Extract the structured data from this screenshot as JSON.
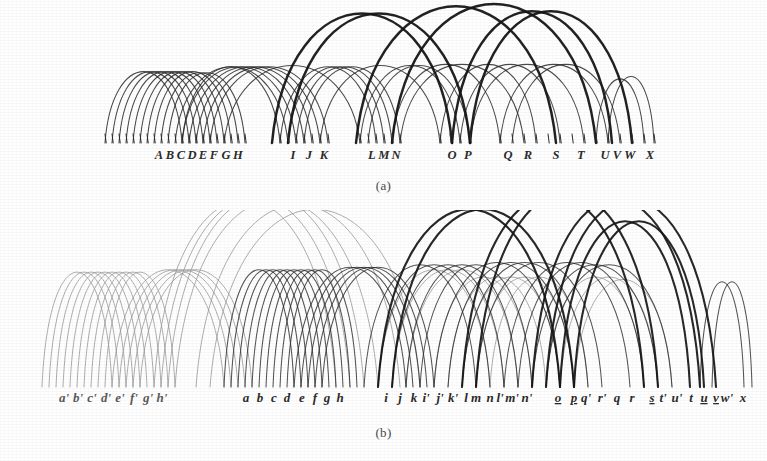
{
  "figure": {
    "type": "arc-diagram-pair",
    "background": "#ffffff",
    "ink_color": "#2b2b2b",
    "faded_ink_color": "#9a9a9a",
    "bold_ink_color": "#161616"
  },
  "captions": {
    "a": "(a)",
    "b": "(b)"
  },
  "panel_a": {
    "name": "panel-a",
    "baseline_y": 143,
    "labels": [
      {
        "text": "A",
        "x": 159
      },
      {
        "text": "B",
        "x": 170
      },
      {
        "text": "C",
        "x": 181
      },
      {
        "text": "D",
        "x": 192
      },
      {
        "text": "E",
        "x": 203
      },
      {
        "text": "F",
        "x": 214
      },
      {
        "text": "G",
        "x": 226
      },
      {
        "text": "H",
        "x": 238
      },
      {
        "text": "I",
        "x": 293
      },
      {
        "text": "J",
        "x": 309
      },
      {
        "text": "K",
        "x": 324
      },
      {
        "text": "L",
        "x": 372
      },
      {
        "text": "M",
        "x": 384
      },
      {
        "text": "N",
        "x": 396
      },
      {
        "text": "O",
        "x": 452
      },
      {
        "text": "P",
        "x": 468
      },
      {
        "text": "Q",
        "x": 508
      },
      {
        "text": "R",
        "x": 528
      },
      {
        "text": "S",
        "x": 556
      },
      {
        "text": "T",
        "x": 581
      },
      {
        "text": "U",
        "x": 605
      },
      {
        "text": "V",
        "x": 617
      },
      {
        "text": "W",
        "x": 630
      },
      {
        "text": "X",
        "x": 650
      }
    ],
    "ticks": [
      105,
      112,
      119,
      126,
      133,
      140,
      147,
      154,
      161,
      168,
      175,
      182,
      189,
      196,
      203,
      210,
      217,
      224,
      231,
      238,
      245,
      280,
      288,
      296,
      304,
      312,
      320,
      328,
      360,
      368,
      376,
      384,
      392,
      400,
      440,
      450,
      460,
      470,
      500,
      512,
      524,
      536,
      548,
      560,
      572,
      584,
      596,
      608,
      620,
      632,
      644,
      654
    ],
    "arcs_thin": [
      {
        "x1": 105,
        "x2": 182,
        "top": 84
      },
      {
        "x1": 112,
        "x2": 189,
        "top": 84
      },
      {
        "x1": 119,
        "x2": 196,
        "top": 84
      },
      {
        "x1": 126,
        "x2": 203,
        "top": 84
      },
      {
        "x1": 133,
        "x2": 210,
        "top": 84
      },
      {
        "x1": 140,
        "x2": 217,
        "top": 84
      },
      {
        "x1": 147,
        "x2": 224,
        "top": 84
      },
      {
        "x1": 154,
        "x2": 231,
        "top": 84
      },
      {
        "x1": 161,
        "x2": 238,
        "top": 85
      },
      {
        "x1": 168,
        "x2": 245,
        "top": 85
      },
      {
        "x1": 175,
        "x2": 288,
        "top": 80
      },
      {
        "x1": 182,
        "x2": 296,
        "top": 80
      },
      {
        "x1": 189,
        "x2": 304,
        "top": 80
      },
      {
        "x1": 196,
        "x2": 312,
        "top": 80
      },
      {
        "x1": 203,
        "x2": 320,
        "top": 80
      },
      {
        "x1": 210,
        "x2": 328,
        "top": 80
      },
      {
        "x1": 280,
        "x2": 376,
        "top": 80
      },
      {
        "x1": 288,
        "x2": 384,
        "top": 80
      },
      {
        "x1": 296,
        "x2": 392,
        "top": 80
      },
      {
        "x1": 304,
        "x2": 400,
        "top": 80
      },
      {
        "x1": 360,
        "x2": 460,
        "top": 79
      },
      {
        "x1": 368,
        "x2": 470,
        "top": 79
      },
      {
        "x1": 400,
        "x2": 524,
        "top": 78
      },
      {
        "x1": 440,
        "x2": 536,
        "top": 78
      },
      {
        "x1": 460,
        "x2": 560,
        "top": 78
      },
      {
        "x1": 470,
        "x2": 584,
        "top": 78
      },
      {
        "x1": 500,
        "x2": 608,
        "top": 78
      },
      {
        "x1": 512,
        "x2": 620,
        "top": 78
      },
      {
        "x1": 596,
        "x2": 644,
        "top": 90
      },
      {
        "x1": 608,
        "x2": 654,
        "top": 88
      },
      {
        "x1": 182,
        "x2": 280,
        "top": 80
      },
      {
        "x1": 224,
        "x2": 360,
        "top": 79
      },
      {
        "x1": 320,
        "x2": 440,
        "top": 79
      },
      {
        "x1": 392,
        "x2": 500,
        "top": 78
      }
    ],
    "arcs_bold": [
      {
        "x1": 272,
        "x2": 452,
        "top": 36
      },
      {
        "x1": 288,
        "x2": 470,
        "top": 36
      },
      {
        "x1": 356,
        "x2": 556,
        "top": 30
      },
      {
        "x1": 392,
        "x2": 596,
        "top": 28
      },
      {
        "x1": 452,
        "x2": 612,
        "top": 34
      },
      {
        "x1": 470,
        "x2": 632,
        "top": 34
      }
    ]
  },
  "panel_b": {
    "name": "panel-b",
    "baseline_y": 387,
    "labels": [
      {
        "text": "a'",
        "x": 64,
        "faded": true
      },
      {
        "text": "b'",
        "x": 78,
        "faded": true
      },
      {
        "text": "c'",
        "x": 92,
        "faded": true
      },
      {
        "text": "d'",
        "x": 106,
        "faded": true
      },
      {
        "text": "e'",
        "x": 120,
        "faded": true
      },
      {
        "text": "f'",
        "x": 134,
        "faded": true
      },
      {
        "text": "g'",
        "x": 148,
        "faded": true
      },
      {
        "text": "h'",
        "x": 162,
        "faded": true
      },
      {
        "text": "a",
        "x": 246,
        "faded": false
      },
      {
        "text": "b",
        "x": 260,
        "faded": false
      },
      {
        "text": "c",
        "x": 274,
        "faded": false
      },
      {
        "text": "d",
        "x": 287,
        "faded": false
      },
      {
        "text": "e",
        "x": 302,
        "faded": false
      },
      {
        "text": "f",
        "x": 315,
        "faded": false
      },
      {
        "text": "g",
        "x": 327,
        "faded": false
      },
      {
        "text": "h",
        "x": 340,
        "faded": false
      },
      {
        "text": "i",
        "x": 386,
        "faded": false
      },
      {
        "text": "j",
        "x": 400,
        "faded": false
      },
      {
        "text": "k",
        "x": 414,
        "faded": false
      },
      {
        "text": "i'",
        "x": 426,
        "faded": false
      },
      {
        "text": "j'",
        "x": 440,
        "faded": false
      },
      {
        "text": "k'",
        "x": 453,
        "faded": false
      },
      {
        "text": "l",
        "x": 466,
        "faded": false
      },
      {
        "text": "m",
        "x": 476,
        "faded": false
      },
      {
        "text": "n",
        "x": 490,
        "faded": false
      },
      {
        "text": "l'",
        "x": 500,
        "faded": false
      },
      {
        "text": "m'",
        "x": 512,
        "faded": false
      },
      {
        "text": "n'",
        "x": 527,
        "faded": false
      },
      {
        "text": "o",
        "x": 558,
        "faded": false,
        "underline": true
      },
      {
        "text": "p",
        "x": 574,
        "faded": false,
        "underline": true
      },
      {
        "text": "q'",
        "x": 586,
        "faded": false
      },
      {
        "text": "r'",
        "x": 602,
        "faded": false
      },
      {
        "text": "q",
        "x": 617,
        "faded": false
      },
      {
        "text": "r",
        "x": 632,
        "faded": false
      },
      {
        "text": "s",
        "x": 652,
        "faded": false,
        "underline": true
      },
      {
        "text": "t'",
        "x": 663,
        "faded": false
      },
      {
        "text": "u'",
        "x": 677,
        "faded": false
      },
      {
        "text": "t",
        "x": 691,
        "faded": false
      },
      {
        "text": "u",
        "x": 704,
        "faded": false,
        "underline": true
      },
      {
        "text": "v",
        "x": 716,
        "faded": false,
        "underline": true
      },
      {
        "text": "w'",
        "x": 727,
        "faded": false
      },
      {
        "text": "x",
        "x": 743,
        "faded": false
      }
    ],
    "arcs_faded": [
      {
        "x1": 42,
        "x2": 112,
        "top": 292
      },
      {
        "x1": 49,
        "x2": 119,
        "top": 292
      },
      {
        "x1": 56,
        "x2": 126,
        "top": 292
      },
      {
        "x1": 63,
        "x2": 133,
        "top": 292
      },
      {
        "x1": 70,
        "x2": 140,
        "top": 292
      },
      {
        "x1": 77,
        "x2": 147,
        "top": 292
      },
      {
        "x1": 84,
        "x2": 154,
        "top": 292
      },
      {
        "x1": 91,
        "x2": 161,
        "top": 292
      },
      {
        "x1": 98,
        "x2": 168,
        "top": 292
      },
      {
        "x1": 105,
        "x2": 175,
        "top": 292
      },
      {
        "x1": 112,
        "x2": 224,
        "top": 290
      },
      {
        "x1": 119,
        "x2": 231,
        "top": 290
      },
      {
        "x1": 126,
        "x2": 238,
        "top": 290
      },
      {
        "x1": 133,
        "x2": 245,
        "top": 290
      },
      {
        "x1": 140,
        "x2": 252,
        "top": 290
      },
      {
        "x1": 154,
        "x2": 336,
        "top": 232
      },
      {
        "x1": 161,
        "x2": 350,
        "top": 230
      },
      {
        "x1": 168,
        "x2": 364,
        "top": 228
      },
      {
        "x1": 175,
        "x2": 378,
        "top": 232
      },
      {
        "x1": 196,
        "x2": 400,
        "top": 236
      },
      {
        "x1": 210,
        "x2": 420,
        "top": 240
      },
      {
        "x1": 434,
        "x2": 532,
        "top": 296
      },
      {
        "x1": 448,
        "x2": 546,
        "top": 296
      },
      {
        "x1": 462,
        "x2": 560,
        "top": 296
      },
      {
        "x1": 476,
        "x2": 574,
        "top": 296
      },
      {
        "x1": 490,
        "x2": 588,
        "top": 296
      },
      {
        "x1": 546,
        "x2": 644,
        "top": 296
      },
      {
        "x1": 560,
        "x2": 658,
        "top": 296
      },
      {
        "x1": 574,
        "x2": 672,
        "top": 298
      },
      {
        "x1": 378,
        "x2": 490,
        "top": 290
      },
      {
        "x1": 392,
        "x2": 504,
        "top": 290
      },
      {
        "x1": 406,
        "x2": 518,
        "top": 290
      }
    ],
    "arcs_thin": [
      {
        "x1": 224,
        "x2": 294,
        "top": 290
      },
      {
        "x1": 231,
        "x2": 301,
        "top": 290
      },
      {
        "x1": 238,
        "x2": 308,
        "top": 290
      },
      {
        "x1": 245,
        "x2": 315,
        "top": 290
      },
      {
        "x1": 252,
        "x2": 322,
        "top": 290
      },
      {
        "x1": 259,
        "x2": 329,
        "top": 290
      },
      {
        "x1": 266,
        "x2": 336,
        "top": 290
      },
      {
        "x1": 273,
        "x2": 343,
        "top": 290
      },
      {
        "x1": 280,
        "x2": 350,
        "top": 290
      },
      {
        "x1": 287,
        "x2": 357,
        "top": 290
      },
      {
        "x1": 294,
        "x2": 406,
        "top": 288
      },
      {
        "x1": 301,
        "x2": 413,
        "top": 288
      },
      {
        "x1": 308,
        "x2": 420,
        "top": 288
      },
      {
        "x1": 315,
        "x2": 427,
        "top": 288
      },
      {
        "x1": 322,
        "x2": 434,
        "top": 288
      },
      {
        "x1": 364,
        "x2": 476,
        "top": 286
      },
      {
        "x1": 378,
        "x2": 490,
        "top": 286
      },
      {
        "x1": 392,
        "x2": 504,
        "top": 286
      },
      {
        "x1": 406,
        "x2": 518,
        "top": 286
      },
      {
        "x1": 420,
        "x2": 532,
        "top": 286
      },
      {
        "x1": 434,
        "x2": 560,
        "top": 284
      },
      {
        "x1": 448,
        "x2": 574,
        "top": 284
      },
      {
        "x1": 462,
        "x2": 588,
        "top": 284
      },
      {
        "x1": 476,
        "x2": 602,
        "top": 284
      },
      {
        "x1": 504,
        "x2": 630,
        "top": 284
      },
      {
        "x1": 518,
        "x2": 644,
        "top": 284
      },
      {
        "x1": 532,
        "x2": 658,
        "top": 286
      },
      {
        "x1": 546,
        "x2": 672,
        "top": 286
      },
      {
        "x1": 700,
        "x2": 744,
        "top": 300
      },
      {
        "x1": 712,
        "x2": 752,
        "top": 300
      }
    ],
    "arcs_bold": [
      {
        "x1": 378,
        "x2": 560,
        "top": 240
      },
      {
        "x1": 392,
        "x2": 574,
        "top": 240
      },
      {
        "x1": 462,
        "x2": 644,
        "top": 228
      },
      {
        "x1": 476,
        "x2": 658,
        "top": 226
      },
      {
        "x1": 532,
        "x2": 700,
        "top": 232
      },
      {
        "x1": 546,
        "x2": 716,
        "top": 232
      },
      {
        "x1": 560,
        "x2": 690,
        "top": 250
      },
      {
        "x1": 574,
        "x2": 704,
        "top": 250
      }
    ]
  }
}
